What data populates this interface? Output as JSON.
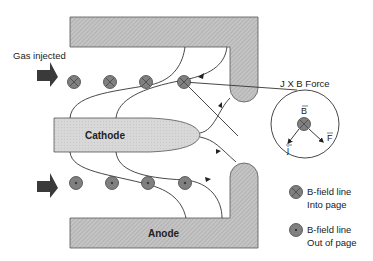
{
  "labels": {
    "gas_injected": "Gas injected",
    "cathode": "Cathode",
    "anode": "Anode",
    "jxb_force": "J X B Force",
    "vec_b": "B",
    "vec_f": "F",
    "vec_j": "j"
  },
  "legend": [
    {
      "icon": "b-field-into-page-icon",
      "line1": "B-field line",
      "line2": "Into page"
    },
    {
      "icon": "b-field-out-of-page-icon",
      "line1": "B-field line",
      "line2": "Out of page"
    }
  ],
  "colors": {
    "electrode_fill": "#bdbdbd",
    "cathode_fill": "#d6d6d6",
    "marker_fill": "#808080",
    "arrow_fill": "#3a3a3a",
    "line": "#333333"
  }
}
